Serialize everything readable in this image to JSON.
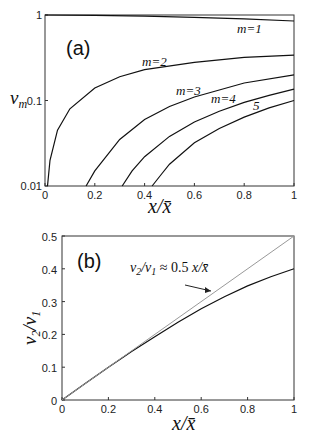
{
  "chart_data": [
    {
      "type": "line",
      "panel_label": "(a)",
      "ylabel": "v_m",
      "xlabel": "x/x̄",
      "yscale": "log",
      "xlim": [
        0,
        1
      ],
      "ylim": [
        0.01,
        1
      ],
      "xticks": [
        "0",
        "0.2",
        "0.4",
        "0.6",
        "0.8",
        "1"
      ],
      "yticks": [
        "0.01",
        "0.1",
        "1"
      ],
      "series": [
        {
          "name": "m=1",
          "label": "m=1",
          "x": [
            0,
            0.2,
            0.4,
            0.6,
            0.8,
            1.0
          ],
          "y": [
            1.0,
            0.99,
            0.97,
            0.94,
            0.9,
            0.85
          ]
        },
        {
          "name": "m=2",
          "label": "m=2",
          "x": [
            0.01,
            0.02,
            0.05,
            0.1,
            0.2,
            0.3,
            0.4,
            0.6,
            0.8,
            1.0
          ],
          "y": [
            0.01,
            0.02,
            0.045,
            0.08,
            0.14,
            0.19,
            0.23,
            0.28,
            0.32,
            0.34
          ]
        },
        {
          "name": "m=3",
          "label": "m=3",
          "x": [
            0.165,
            0.2,
            0.3,
            0.4,
            0.5,
            0.6,
            0.8,
            1.0
          ],
          "y": [
            0.01,
            0.015,
            0.035,
            0.06,
            0.085,
            0.11,
            0.16,
            0.2
          ]
        },
        {
          "name": "m=4",
          "label": "m=4",
          "x": [
            0.31,
            0.35,
            0.4,
            0.5,
            0.6,
            0.7,
            0.8,
            0.9,
            1.0
          ],
          "y": [
            0.01,
            0.015,
            0.022,
            0.038,
            0.056,
            0.075,
            0.095,
            0.115,
            0.136
          ]
        },
        {
          "name": "m=5",
          "label": "5",
          "x": [
            0.43,
            0.47,
            0.5,
            0.6,
            0.7,
            0.8,
            0.9,
            1.0
          ],
          "y": [
            0.01,
            0.014,
            0.018,
            0.032,
            0.047,
            0.064,
            0.082,
            0.1
          ]
        }
      ]
    },
    {
      "type": "line",
      "panel_label": "(b)",
      "ylabel": "v2/v1",
      "xlabel": "x/x̄",
      "xlim": [
        0,
        1
      ],
      "ylim": [
        0,
        0.5
      ],
      "xticks": [
        "0",
        "0.2",
        "0.4",
        "0.6",
        "0.8",
        "1"
      ],
      "yticks": [
        "0",
        "0.1",
        "0.2",
        "0.3",
        "0.4",
        "0.5"
      ],
      "annotation": "v2/v1 ≈ 0.5 x/x̄",
      "series": [
        {
          "name": "v2/v1",
          "style": "solid",
          "x": [
            0,
            0.1,
            0.2,
            0.3,
            0.4,
            0.5,
            0.6,
            0.7,
            0.8,
            0.9,
            1.0
          ],
          "y": [
            0,
            0.05,
            0.1,
            0.148,
            0.193,
            0.237,
            0.278,
            0.315,
            0.348,
            0.376,
            0.4
          ]
        },
        {
          "name": "0.5 x/x̄",
          "style": "dotted",
          "x": [
            0,
            1.0
          ],
          "y": [
            0,
            0.5
          ]
        }
      ]
    }
  ]
}
